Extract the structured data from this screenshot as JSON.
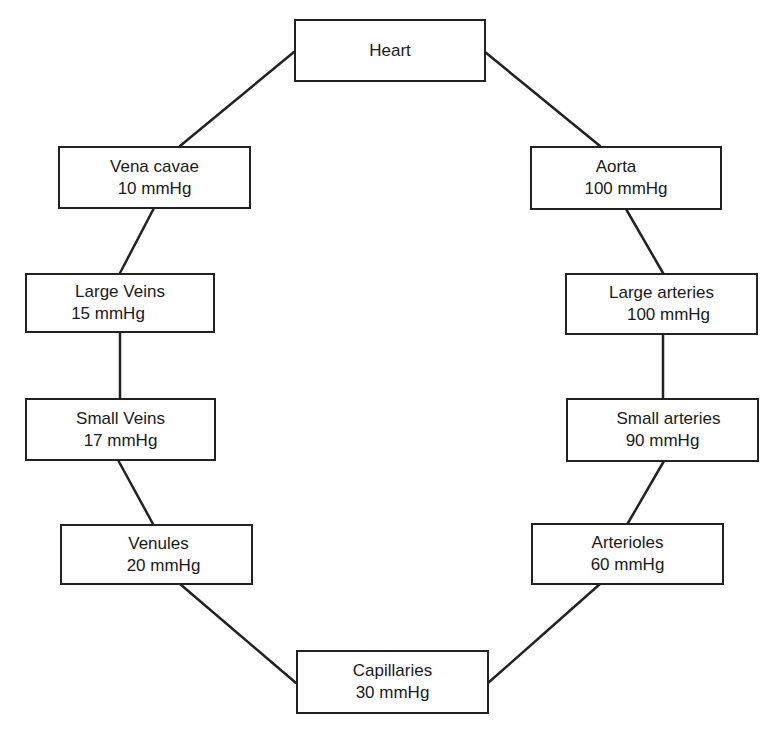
{
  "diagram": {
    "nodes": {
      "heart": {
        "name": "Heart",
        "pressure": ""
      },
      "vena_cavae": {
        "name": "Vena cavae",
        "pressure": "10 mmHg"
      },
      "aorta": {
        "name": "Aorta",
        "pressure": "100 mmHg"
      },
      "large_veins": {
        "name": "Large Veins",
        "pressure": "15 mmHg"
      },
      "large_arteries": {
        "name": "Large arteries",
        "pressure": "100 mmHg"
      },
      "small_veins": {
        "name": "Small Veins",
        "pressure": "17 mmHg"
      },
      "small_arteries": {
        "name": "Small arteries",
        "pressure": "90 mmHg"
      },
      "venules": {
        "name": "Venules",
        "pressure": "20 mmHg"
      },
      "arterioles": {
        "name": "Arterioles",
        "pressure": "60 mmHg"
      },
      "capillaries": {
        "name": "Capillaries",
        "pressure": "30 mmHg"
      }
    },
    "edges": [
      [
        "heart",
        "aorta"
      ],
      [
        "aorta",
        "large_arteries"
      ],
      [
        "large_arteries",
        "small_arteries"
      ],
      [
        "small_arteries",
        "arterioles"
      ],
      [
        "arterioles",
        "capillaries"
      ],
      [
        "capillaries",
        "venules"
      ],
      [
        "venules",
        "small_veins"
      ],
      [
        "small_veins",
        "large_veins"
      ],
      [
        "large_veins",
        "vena_cavae"
      ],
      [
        "vena_cavae",
        "heart"
      ]
    ],
    "line_color": "#222222"
  }
}
